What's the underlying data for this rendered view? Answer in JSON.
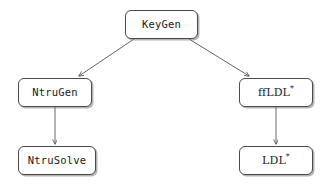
{
  "diagram": {
    "type": "flowchart",
    "background_color": "#ffffff",
    "node_border_color": "#4a4a4a",
    "node_fill_color": "#ffffff",
    "edge_color": "#555555",
    "text_color": "#1a1a1a",
    "nodes": [
      {
        "id": "keygen",
        "label": "KeyGen",
        "shape": "rounded-rectangle"
      },
      {
        "id": "ntrugen",
        "label": "NtruGen",
        "shape": "rounded-rectangle"
      },
      {
        "id": "ffldl",
        "label": "ffLDL",
        "suffix": "*",
        "shape": "rounded-rectangle"
      },
      {
        "id": "ntrusolve",
        "label": "NtruSolve",
        "shape": "rounded-rectangle"
      },
      {
        "id": "ldl",
        "label": "LDL",
        "suffix": "*",
        "shape": "rounded-rectangle"
      }
    ],
    "edges": [
      {
        "from": "keygen",
        "to": "ntrugen",
        "style": "diagonal-arrow"
      },
      {
        "from": "keygen",
        "to": "ffldl",
        "style": "diagonal-arrow"
      },
      {
        "from": "ntrugen",
        "to": "ntrusolve",
        "style": "vertical-arrow"
      },
      {
        "from": "ffldl",
        "to": "ldl",
        "style": "vertical-arrow"
      }
    ]
  }
}
